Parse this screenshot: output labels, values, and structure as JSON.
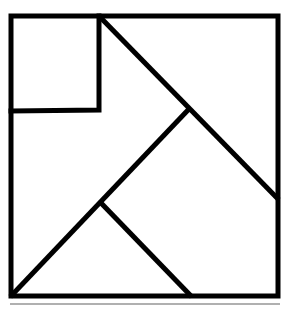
{
  "diagram": {
    "type": "tangram-square",
    "stroke_color": "#000000",
    "underline_color": "#b0b0b0",
    "background": "#ffffff",
    "pieces": [
      {
        "name": "small-square",
        "shape": "square"
      },
      {
        "name": "top-right-triangle",
        "shape": "triangle"
      },
      {
        "name": "left-pentagon",
        "shape": "polygon"
      },
      {
        "name": "bottom-triangle",
        "shape": "triangle"
      },
      {
        "name": "right-pentagon",
        "shape": "polygon"
      }
    ]
  }
}
